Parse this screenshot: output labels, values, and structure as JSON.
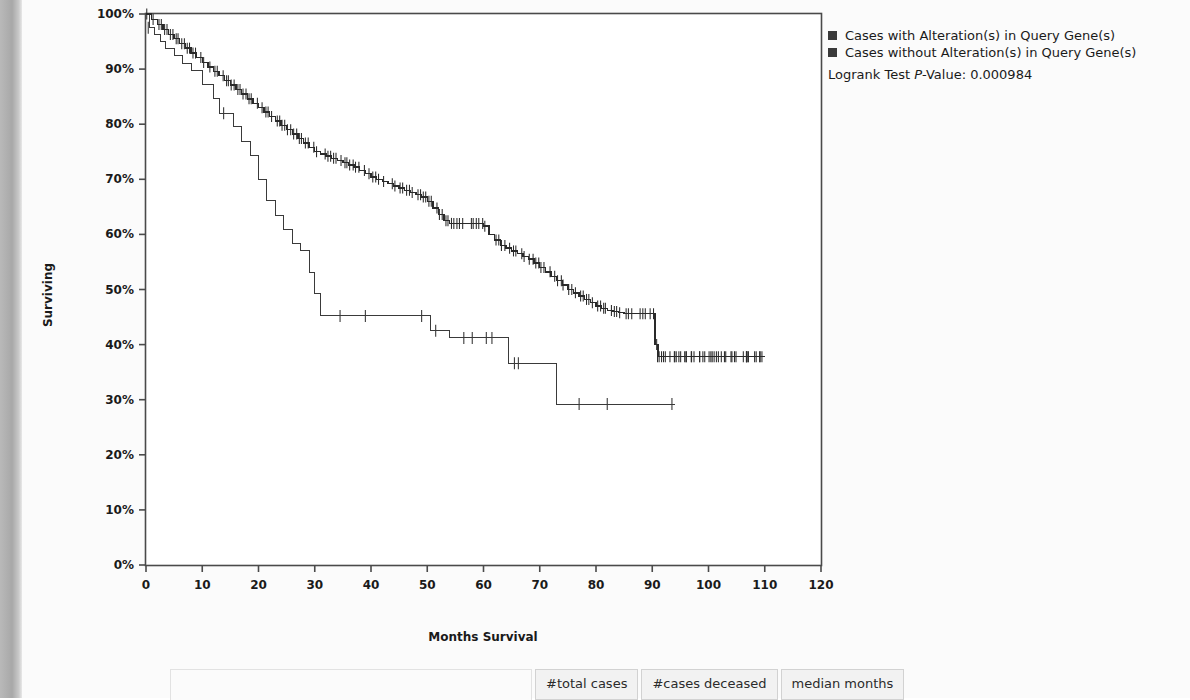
{
  "legend": {
    "items": [
      {
        "label": "Cases with Alteration(s) in Query Gene(s)",
        "color": "#3a3a3a",
        "icon": "square-swatch"
      },
      {
        "label": "Cases without Alteration(s) in Query Gene(s)",
        "color": "#3a3a3a",
        "icon": "square-swatch"
      }
    ],
    "logrank_prefix": "Logrank Test ",
    "logrank_p": "P",
    "logrank_suffix": "-Value: 0.000984"
  },
  "table": {
    "blank_header": "",
    "headers": [
      "#total cases",
      "#cases deceased",
      "median months"
    ]
  },
  "chart_data": {
    "type": "line",
    "title": "",
    "xlabel": "Months Survival",
    "ylabel": "Surviving",
    "xlim": [
      0,
      120
    ],
    "ylim": [
      0,
      1
    ],
    "xticks": [
      0,
      10,
      20,
      30,
      40,
      50,
      60,
      70,
      80,
      90,
      100,
      110,
      120
    ],
    "xticklabels": [
      "0",
      "10",
      "20",
      "30",
      "40",
      "50",
      "60",
      "70",
      "80",
      "90",
      "100",
      "110",
      "120"
    ],
    "yticks": [
      0,
      0.1,
      0.2,
      0.3,
      0.4,
      0.5,
      0.6,
      0.7,
      0.8,
      0.9,
      1.0
    ],
    "yticklabels": [
      "0%",
      "10%",
      "20%",
      "30%",
      "40%",
      "50%",
      "60%",
      "70%",
      "80%",
      "90%",
      "100%"
    ],
    "grid": false,
    "legend_position": "outside-right-top",
    "series": [
      {
        "name": "Cases with Alteration(s) in Query Gene(s)",
        "color": "#3a3a3a",
        "linewidth": 1.0,
        "steps": [
          [
            0,
            1.0
          ],
          [
            0.7,
            0.975
          ],
          [
            1.5,
            0.962
          ],
          [
            2.5,
            0.95
          ],
          [
            3.5,
            0.937
          ],
          [
            5.0,
            0.924
          ],
          [
            6.5,
            0.911
          ],
          [
            8.0,
            0.898
          ],
          [
            10.0,
            0.872
          ],
          [
            12.0,
            0.846
          ],
          [
            13.0,
            0.82
          ],
          [
            14.5,
            0.82
          ],
          [
            15.5,
            0.795
          ],
          [
            17.0,
            0.769
          ],
          [
            18.5,
            0.743
          ],
          [
            20.0,
            0.7
          ],
          [
            21.5,
            0.661
          ],
          [
            23.0,
            0.635
          ],
          [
            24.5,
            0.609
          ],
          [
            26.0,
            0.583
          ],
          [
            27.5,
            0.57
          ],
          [
            29.0,
            0.531
          ],
          [
            30.0,
            0.492
          ],
          [
            31.0,
            0.452
          ],
          [
            34.0,
            0.452
          ],
          [
            49.0,
            0.452
          ],
          [
            50.5,
            0.425
          ],
          [
            54.0,
            0.412
          ],
          [
            57.0,
            0.412
          ],
          [
            62.0,
            0.412
          ],
          [
            64.5,
            0.366
          ],
          [
            67.0,
            0.366
          ],
          [
            73.0,
            0.292
          ],
          [
            78.0,
            0.292
          ],
          [
            94.0,
            0.292
          ]
        ],
        "censor_marks": [
          [
            0.4,
            0.975
          ],
          [
            13.8,
            0.82
          ],
          [
            34.5,
            0.452
          ],
          [
            39.0,
            0.452
          ],
          [
            49.0,
            0.452
          ],
          [
            51.5,
            0.425
          ],
          [
            56.5,
            0.412
          ],
          [
            58.0,
            0.412
          ],
          [
            60.5,
            0.412
          ],
          [
            61.5,
            0.412
          ],
          [
            65.5,
            0.366
          ],
          [
            66.2,
            0.366
          ],
          [
            77.0,
            0.292
          ],
          [
            82.0,
            0.292
          ],
          [
            93.5,
            0.292
          ]
        ],
        "final_survival": 0.292,
        "max_time": 94.0
      },
      {
        "name": "Cases without Alteration(s) in Query Gene(s)",
        "color": "#2a2a2a",
        "linewidth": 1.4,
        "steps": [
          [
            0,
            1.0
          ],
          [
            1,
            0.99
          ],
          [
            2,
            0.981
          ],
          [
            3,
            0.972
          ],
          [
            4,
            0.963
          ],
          [
            5,
            0.955
          ],
          [
            6,
            0.946
          ],
          [
            7,
            0.938
          ],
          [
            8,
            0.929
          ],
          [
            9,
            0.921
          ],
          [
            10,
            0.912
          ],
          [
            11,
            0.904
          ],
          [
            12,
            0.896
          ],
          [
            13,
            0.888
          ],
          [
            14,
            0.879
          ],
          [
            15,
            0.871
          ],
          [
            16,
            0.863
          ],
          [
            17,
            0.855
          ],
          [
            18,
            0.846
          ],
          [
            19,
            0.838
          ],
          [
            20,
            0.83
          ],
          [
            21,
            0.822
          ],
          [
            22,
            0.814
          ],
          [
            23,
            0.806
          ],
          [
            24,
            0.798
          ],
          [
            25,
            0.79
          ],
          [
            26,
            0.782
          ],
          [
            27,
            0.774
          ],
          [
            28,
            0.766
          ],
          [
            29,
            0.758
          ],
          [
            30,
            0.75
          ],
          [
            31,
            0.746
          ],
          [
            32,
            0.742
          ],
          [
            33,
            0.738
          ],
          [
            34,
            0.734
          ],
          [
            35,
            0.73
          ],
          [
            36,
            0.726
          ],
          [
            37,
            0.722
          ],
          [
            38,
            0.716
          ],
          [
            39,
            0.71
          ],
          [
            40,
            0.704
          ],
          [
            41,
            0.7
          ],
          [
            42,
            0.696
          ],
          [
            43,
            0.692
          ],
          [
            44,
            0.688
          ],
          [
            45,
            0.684
          ],
          [
            46,
            0.68
          ],
          [
            47,
            0.676
          ],
          [
            48,
            0.672
          ],
          [
            49,
            0.668
          ],
          [
            50,
            0.66
          ],
          [
            51,
            0.648
          ],
          [
            52,
            0.636
          ],
          [
            53,
            0.625
          ],
          [
            54,
            0.62
          ],
          [
            55,
            0.62
          ],
          [
            56,
            0.62
          ],
          [
            57,
            0.62
          ],
          [
            58,
            0.62
          ],
          [
            59,
            0.62
          ],
          [
            60,
            0.615
          ],
          [
            61,
            0.6
          ],
          [
            62,
            0.59
          ],
          [
            63,
            0.58
          ],
          [
            64,
            0.575
          ],
          [
            65,
            0.57
          ],
          [
            66,
            0.565
          ],
          [
            67,
            0.56
          ],
          [
            68,
            0.555
          ],
          [
            69,
            0.548
          ],
          [
            70,
            0.54
          ],
          [
            71,
            0.532
          ],
          [
            72,
            0.524
          ],
          [
            73,
            0.516
          ],
          [
            74,
            0.508
          ],
          [
            75,
            0.5
          ],
          [
            76,
            0.494
          ],
          [
            77,
            0.488
          ],
          [
            78,
            0.482
          ],
          [
            79,
            0.476
          ],
          [
            80,
            0.47
          ],
          [
            81,
            0.466
          ],
          [
            82,
            0.462
          ],
          [
            83,
            0.46
          ],
          [
            84,
            0.458
          ],
          [
            85,
            0.456
          ],
          [
            86,
            0.456
          ],
          [
            87,
            0.456
          ],
          [
            88,
            0.456
          ],
          [
            89,
            0.456
          ],
          [
            90,
            0.456
          ],
          [
            90.5,
            0.4
          ],
          [
            91,
            0.378
          ],
          [
            95,
            0.378
          ],
          [
            100,
            0.378
          ],
          [
            105,
            0.378
          ],
          [
            110,
            0.378
          ]
        ],
        "censor_density": "high",
        "final_survival": 0.378,
        "max_time": 110.0
      }
    ]
  }
}
